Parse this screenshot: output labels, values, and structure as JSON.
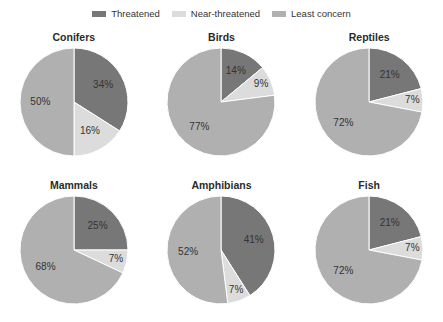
{
  "chart_data": {
    "type": "pie",
    "title": "",
    "legend": {
      "position": "top-center",
      "entries": [
        {
          "label": "Threatened",
          "color": "#777777"
        },
        {
          "label": "Near-threatened",
          "color": "#dcdcdc"
        },
        {
          "label": "Least concern",
          "color": "#b0b0b0"
        }
      ]
    },
    "series": [
      {
        "name": "Threatened",
        "color": "#777777",
        "values": [
          34,
          14,
          21,
          25,
          41,
          21
        ]
      },
      {
        "name": "Near-threatened",
        "color": "#dcdcdc",
        "values": [
          16,
          9,
          7,
          7,
          7,
          7
        ]
      },
      {
        "name": "Least concern",
        "color": "#b0b0b0",
        "values": [
          50,
          77,
          72,
          68,
          52,
          72
        ]
      }
    ],
    "categories": [
      "Conifers",
      "Birds",
      "Reptiles",
      "Mammals",
      "Amphibians",
      "Fish"
    ],
    "units": "percent",
    "charts": [
      {
        "title": "Conifers",
        "slices": [
          {
            "label": "Threatened",
            "value": 34,
            "display": "34%",
            "color": "#777777"
          },
          {
            "label": "Near-threatened",
            "value": 16,
            "display": "16%",
            "color": "#dcdcdc"
          },
          {
            "label": "Least concern",
            "value": 50,
            "display": "50%",
            "color": "#b0b0b0"
          }
        ]
      },
      {
        "title": "Birds",
        "slices": [
          {
            "label": "Threatened",
            "value": 14,
            "display": "14%",
            "color": "#777777"
          },
          {
            "label": "Near-threatened",
            "value": 9,
            "display": "9%",
            "color": "#dcdcdc"
          },
          {
            "label": "Least concern",
            "value": 77,
            "display": "77%",
            "color": "#b0b0b0"
          }
        ]
      },
      {
        "title": "Reptiles",
        "slices": [
          {
            "label": "Threatened",
            "value": 21,
            "display": "21%",
            "color": "#777777"
          },
          {
            "label": "Near-threatened",
            "value": 7,
            "display": "7%",
            "color": "#dcdcdc"
          },
          {
            "label": "Least concern",
            "value": 72,
            "display": "72%",
            "color": "#b0b0b0"
          }
        ]
      },
      {
        "title": "Mammals",
        "slices": [
          {
            "label": "Threatened",
            "value": 25,
            "display": "25%",
            "color": "#777777"
          },
          {
            "label": "Near-threatened",
            "value": 7,
            "display": "7%",
            "color": "#dcdcdc"
          },
          {
            "label": "Least concern",
            "value": 68,
            "display": "68%",
            "color": "#b0b0b0"
          }
        ]
      },
      {
        "title": "Amphibians",
        "slices": [
          {
            "label": "Threatened",
            "value": 41,
            "display": "41%",
            "color": "#777777"
          },
          {
            "label": "Near-threatened",
            "value": 7,
            "display": "7%",
            "color": "#dcdcdc"
          },
          {
            "label": "Least concern",
            "value": 52,
            "display": "52%",
            "color": "#b0b0b0"
          }
        ]
      },
      {
        "title": "Fish",
        "slices": [
          {
            "label": "Threatened",
            "value": 21,
            "display": "21%",
            "color": "#777777"
          },
          {
            "label": "Near-threatened",
            "value": 7,
            "display": "7%",
            "color": "#dcdcdc"
          },
          {
            "label": "Least concern",
            "value": 72,
            "display": "72%",
            "color": "#b0b0b0"
          }
        ]
      }
    ],
    "colors": {
      "threatened": "#777777",
      "near_threatened": "#dcdcdc",
      "least_concern": "#b0b0b0",
      "background": "#ffffff",
      "text": "#333333"
    }
  }
}
